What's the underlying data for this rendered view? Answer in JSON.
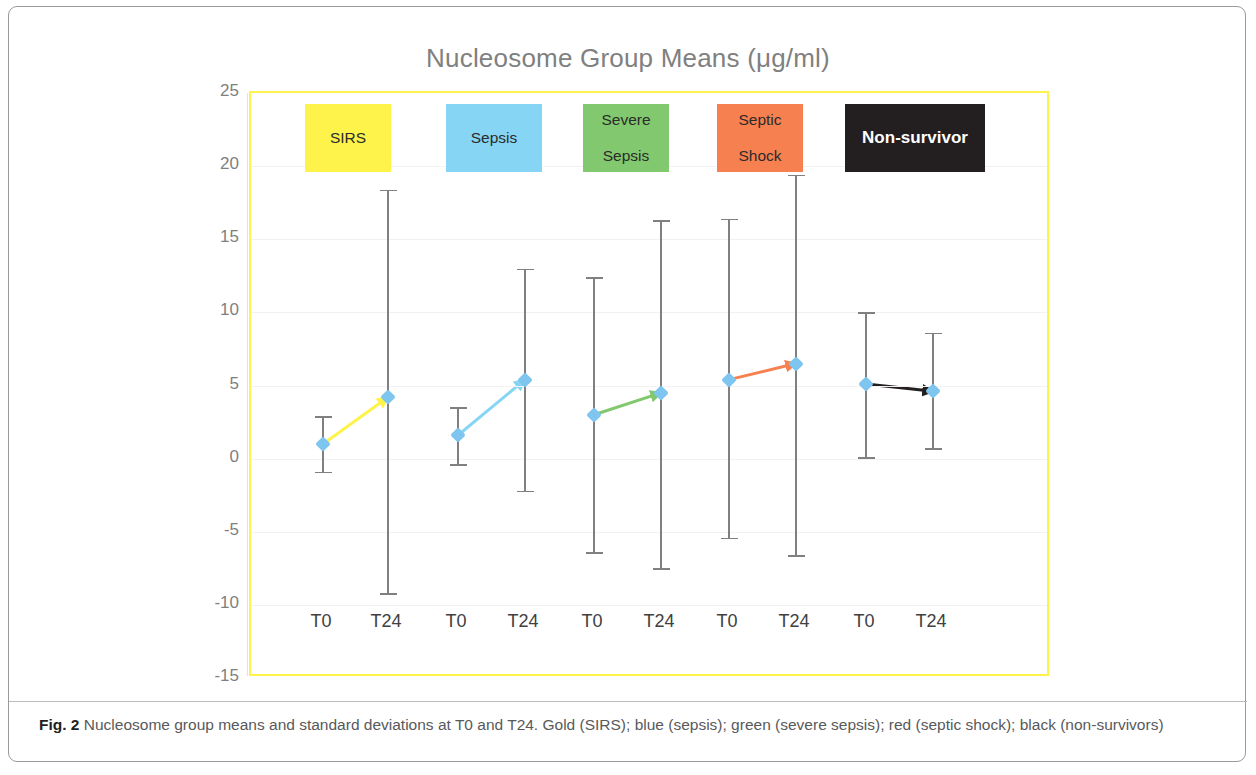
{
  "figure": {
    "caption_label": "Fig. 2",
    "caption_text": " Nucleosome group means and standard deviations at T0 and T24. Gold (SIRS); blue (sepsis); green (severe sepsis); red (septic shock); black (non-survivors)"
  },
  "chart_data": {
    "type": "line",
    "title": "Nucleosome Group Means (μg/ml)",
    "xlabel": "",
    "ylabel": "",
    "ylim": [
      -15,
      25
    ],
    "yticks": [
      25,
      20,
      15,
      10,
      5,
      0,
      -5,
      -10,
      -15
    ],
    "ytick_labels": [
      "25",
      "20",
      "15",
      "10",
      "5",
      "0",
      "-5",
      "-10",
      "-15"
    ],
    "grid": true,
    "legend_position": "inside-top",
    "x": [
      "T0",
      "T24",
      "T0",
      "T24",
      "T0",
      "T24",
      "T0",
      "T24",
      "T0",
      "T24"
    ],
    "xtick_labels": [
      "T0",
      "T24",
      "T0",
      "T24",
      "T0",
      "T24",
      "T0",
      "T24",
      "T0",
      "T24"
    ],
    "groups": [
      {
        "name": "SIRS",
        "legend_label": "SIRS",
        "color": "#fdf34a",
        "text_color": "#2b2b2b",
        "box_left": 56,
        "box_width": 86,
        "points": [
          {
            "x_label": "T0",
            "x_pos": 72,
            "mean": 1.0,
            "sd": 1.9,
            "upper": 2.9,
            "lower": -0.9
          },
          {
            "x_label": "T24",
            "x_pos": 137,
            "mean": 4.2,
            "sd": 13.8,
            "upper": 18.4,
            "lower": -9.2
          }
        ]
      },
      {
        "name": "Sepsis",
        "legend_label": "Sepsis",
        "color": "#87d5f5",
        "text_color": "#2b2b2b",
        "box_left": 197,
        "box_width": 96,
        "points": [
          {
            "x_label": "T0",
            "x_pos": 207,
            "mean": 1.6,
            "sd": 1.9,
            "upper": 3.5,
            "lower": -0.4
          },
          {
            "x_label": "T24",
            "x_pos": 274,
            "mean": 5.4,
            "sd": 7.6,
            "upper": 13.0,
            "lower": -2.2
          }
        ]
      },
      {
        "name": "Severe Sepsis",
        "legend_label": "Severe\nSepsis",
        "color": "#82c86e",
        "text_color": "#2b2b2b",
        "box_left": 334,
        "box_width": 86,
        "points": [
          {
            "x_label": "T0",
            "x_pos": 343,
            "mean": 3.0,
            "sd": 9.4,
            "upper": 12.4,
            "lower": -6.4
          },
          {
            "x_label": "T24",
            "x_pos": 410,
            "mean": 4.5,
            "sd": 11.9,
            "upper": 16.3,
            "lower": -7.5
          }
        ]
      },
      {
        "name": "Septic Shock",
        "legend_label": "Septic\nShock",
        "color": "#f78050",
        "text_color": "#2b2b2b",
        "box_left": 468,
        "box_width": 86,
        "points": [
          {
            "x_label": "T0",
            "x_pos": 478,
            "mean": 5.4,
            "sd": 11.0,
            "upper": 16.4,
            "lower": -5.4
          },
          {
            "x_label": "T24",
            "x_pos": 545,
            "mean": 6.5,
            "sd": 12.9,
            "upper": 19.4,
            "lower": -6.6
          }
        ]
      },
      {
        "name": "Non-survivor",
        "legend_label": "Non-survivor",
        "color": "#231f20",
        "text_color": "#ffffff",
        "box_left": 596,
        "box_width": 140,
        "points": [
          {
            "x_label": "T0",
            "x_pos": 615,
            "mean": 5.1,
            "sd": 4.9,
            "upper": 10.0,
            "lower": 0.1
          },
          {
            "x_label": "T24",
            "x_pos": 682,
            "mean": 4.6,
            "sd": 3.9,
            "upper": 8.6,
            "lower": 0.7
          }
        ]
      }
    ],
    "marker_color": "#7ec5ef",
    "errorbar_color": "#808080",
    "plot_border_color": "#fdf34a",
    "title_color": "#808080"
  }
}
